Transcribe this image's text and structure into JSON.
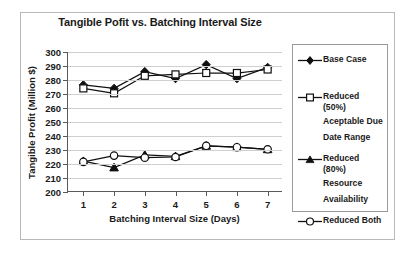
{
  "chart_data": {
    "type": "line",
    "title": "Tangible Pofit vs. Batching Interval Size",
    "xlabel": "Batching Interval Size (Days)",
    "ylabel": "Tangible Profit (Million $)",
    "x": [
      1,
      2,
      3,
      4,
      5,
      6,
      7
    ],
    "xticklabels": [
      "1",
      "2",
      "3",
      "4",
      "5",
      "6",
      "7"
    ],
    "yticklabels": [
      "200",
      "210",
      "220",
      "230",
      "240",
      "250",
      "260",
      "270",
      "280",
      "290",
      "300"
    ],
    "yticks": [
      200,
      210,
      220,
      230,
      240,
      250,
      260,
      270,
      280,
      290,
      300
    ],
    "ylim": [
      200,
      300
    ],
    "xlim": [
      0.5,
      7.5
    ],
    "grid": "horizontal",
    "legend_position": "right",
    "series": [
      {
        "name": "Base Case",
        "marker": "filled-diamond",
        "values": [
          276.5,
          274.0,
          286.0,
          281.0,
          291.0,
          281.0,
          289.0
        ]
      },
      {
        "name": "Reduced (50%) Aceptable Due Date Range",
        "marker": "open-square",
        "values": [
          274.0,
          270.5,
          283.0,
          284.0,
          285.0,
          285.0,
          287.5
        ]
      },
      {
        "name": "Reduced (80%) Resource Availability",
        "marker": "filled-triangle",
        "values": [
          222.0,
          217.5,
          226.5,
          225.5,
          233.0,
          232.0,
          230.5
        ]
      },
      {
        "name": "Reduced Both",
        "marker": "open-circle",
        "values": [
          221.5,
          226.0,
          224.5,
          225.0,
          233.0,
          232.0,
          230.5
        ]
      }
    ]
  },
  "legend": {
    "entries": [
      {
        "label": "Base Case"
      },
      {
        "label": "Reduced (50%)"
      },
      {
        "label": "Aceptable Due"
      },
      {
        "label": "Date Range"
      },
      {
        "label": "Reduced (80%)"
      },
      {
        "label": "Resource"
      },
      {
        "label": "Availability"
      },
      {
        "label": "Reduced Both"
      }
    ]
  },
  "colors": {
    "ink": "#101010",
    "axis": "#5a5a5a",
    "grid": "#d0d0d0",
    "frame": "#b9b9b9",
    "legend_border": "#9a9a9a",
    "background": "#ffffff"
  }
}
